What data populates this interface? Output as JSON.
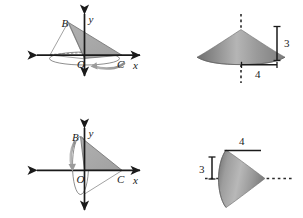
{
  "figure": {
    "colors": {
      "stroke": "#1a1a1a",
      "triangle_fill": "#a8a8a8",
      "cone_light": "#d0d0d0",
      "cone_mid": "#9e9e9e",
      "cone_dark": "#6f6f6f",
      "arrow_gray": "#8a8a8a",
      "background": "#ffffff"
    },
    "panels": [
      {
        "id": "top-left",
        "kind": "axes-triangle",
        "description": "Triangle OBC shaded, rotating about the x-axis",
        "labels": {
          "vertex_b": "B",
          "origin": "O",
          "vertex_c": "C",
          "axis_x": "x",
          "axis_y": "y"
        }
      },
      {
        "id": "top-right",
        "kind": "cone",
        "description": "Upright cone with vertical dashed axis",
        "labels": {
          "height": "3",
          "radius": "4"
        }
      },
      {
        "id": "bottom-left",
        "kind": "axes-triangle",
        "description": "Triangle OBC shaded, rotating about the y-axis",
        "labels": {
          "vertex_b": "B",
          "origin": "O",
          "vertex_c": "C",
          "axis_x": "x",
          "axis_y": "y"
        }
      },
      {
        "id": "bottom-right",
        "kind": "cone",
        "description": "Sideways cone pointing right with horizontal dashed axis",
        "labels": {
          "slant_top": "4",
          "radius": "3"
        }
      }
    ]
  }
}
